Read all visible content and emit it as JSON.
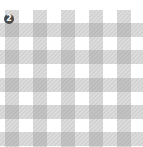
{
  "badge": {
    "number": "2",
    "color": "#4a4a4a",
    "text_color": "#ffffff"
  },
  "pattern": {
    "name": "gingham-check",
    "background": "#ffffff",
    "stripe_color": "#d6d6d6",
    "hatch_color": "#c4c4c4",
    "intersection_color": "#bdbdbd",
    "stripe_width": 14,
    "vertical_stripes_x": [
      5,
      33,
      61,
      89,
      117
    ],
    "horizontal_stripes_y": [
      23,
      50,
      78,
      105,
      132
    ],
    "pattern_top": 10
  }
}
